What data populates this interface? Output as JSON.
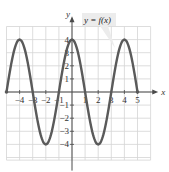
{
  "chart_data": {
    "type": "line",
    "title": "",
    "function_label": "y = f(x)",
    "xlabel": "x",
    "ylabel": "y",
    "xlim": [
      -5,
      5
    ],
    "ylim": [
      -4,
      4
    ],
    "grid": true,
    "x_ticks": [
      -4,
      -3,
      -2,
      -1,
      1,
      2,
      3,
      4,
      5
    ],
    "x_tick_labels": [
      "−4",
      "−3",
      "−2",
      "−1",
      "1",
      "2",
      "3",
      "4",
      "5"
    ],
    "y_ticks": [
      -4,
      -3,
      -2,
      -1,
      1,
      2,
      3,
      4
    ],
    "y_tick_labels": [
      "−4",
      "−3",
      "−2",
      "−1",
      "1",
      "2",
      "3",
      "4"
    ],
    "series": [
      {
        "name": "y = f(x)",
        "x": [
          -5,
          -4,
          -3,
          -2,
          -1,
          0,
          1,
          2,
          3,
          4,
          5
        ],
        "y": [
          0,
          4,
          0,
          -4,
          0,
          4,
          0,
          -4,
          0,
          4,
          0
        ],
        "endpoints_closed": true
      }
    ],
    "colors": {
      "curve": "#5a5a5a",
      "grid": "#d4d4d4",
      "axis": "#4a4a4a",
      "label_bg": "#ececec"
    }
  }
}
